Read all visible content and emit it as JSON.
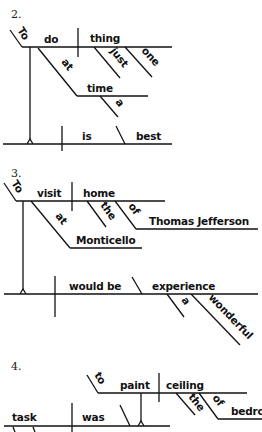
{
  "page": {
    "type": "sentence-diagram-exercises",
    "background": "#ffffff",
    "ink": "#111111"
  },
  "diagrams": [
    {
      "number": "2.",
      "subject_phrase": {
        "infinitive_marker": "To",
        "verb": "do",
        "object": "thing",
        "object_modifiers": [
          "just",
          "one"
        ],
        "prep": "at",
        "prep_object": "time",
        "prep_object_modifier": "a"
      },
      "main_line": {
        "verb": "is",
        "complement": "best"
      }
    },
    {
      "number": "3.",
      "subject_phrase": {
        "infinitive_marker": "To",
        "verb": "visit",
        "object": "home",
        "object_modifiers": [
          "the"
        ],
        "object_prep": "of",
        "object_prep_object": "Thomas Jefferson",
        "prep": "at",
        "prep_object": "Monticello"
      },
      "main_line": {
        "verb": "would be",
        "complement": "experience",
        "complement_modifiers": [
          "a",
          "wonderful"
        ]
      }
    },
    {
      "number": "4.",
      "complement_phrase": {
        "infinitive_marker": "to",
        "verb": "paint",
        "object": "ceiling",
        "object_modifiers": [
          "the"
        ],
        "object_prep": "of",
        "object_prep_object": "bedro"
      },
      "main_line": {
        "subject": "task",
        "verb": "was"
      }
    }
  ]
}
